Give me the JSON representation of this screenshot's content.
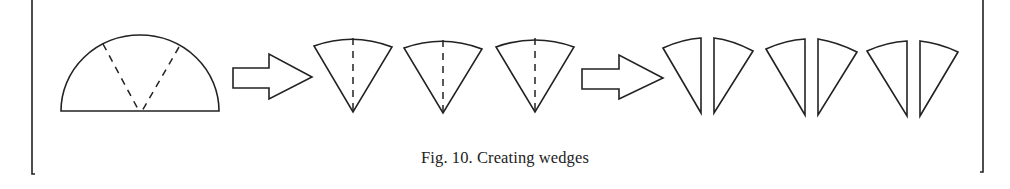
{
  "figure": {
    "caption": "Fig. 10. Creating wedges",
    "stroke_color": "#222222",
    "background_color": "#ffffff",
    "steps": [
      {
        "id": "half-disc",
        "description": "Half disc with two dashed cut lines forming a V"
      },
      {
        "id": "arrow-1",
        "description": "Outline arrow pointing right"
      },
      {
        "id": "wedges",
        "count": 3,
        "description": "Three wedges, each with a vertical dashed center line"
      },
      {
        "id": "arrow-2",
        "description": "Outline arrow pointing right"
      },
      {
        "id": "half-wedges",
        "count": 6,
        "description": "Three pairs of half-wedges split along the center line"
      }
    ]
  }
}
